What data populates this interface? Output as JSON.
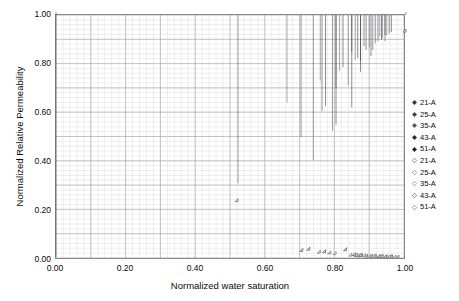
{
  "chart_data": {
    "type": "scatter",
    "title": "",
    "xlabel": "Normalized water saturation",
    "ylabel": "Normalized Relative Permeability",
    "xlim": [
      0.0,
      1.0
    ],
    "ylim": [
      0.0,
      1.0
    ],
    "xticks": [
      "0.00",
      "0.20",
      "0.40",
      "0.60",
      "0.80",
      "1.00"
    ],
    "xtick_values": [
      0.0,
      0.2,
      0.4,
      0.6,
      0.8,
      1.0
    ],
    "yticks": [
      "0.00",
      "0.20",
      "0.40",
      "0.60",
      "0.80",
      "1.00"
    ],
    "ytick_values": [
      0.0,
      0.2,
      0.4,
      0.6,
      0.8,
      1.0
    ],
    "grid": true,
    "grid_minor_step": 0.02,
    "grid_major_step_x": 0.1,
    "grid_major_step_y": 0.1,
    "legend_position": "right",
    "marker": "diamond",
    "series": [
      {
        "name": "21-A",
        "marker": "filled-diamond",
        "color": "#2f2f36",
        "points": [
          [
            0.0,
            1.0
          ],
          [
            0.7,
            0.49
          ],
          [
            0.76,
            0.595
          ],
          [
            0.8,
            0.69
          ],
          [
            0.845,
            0.835
          ],
          [
            0.88,
            0.86
          ],
          [
            0.93,
            0.885
          ],
          [
            1.0,
            1.0
          ]
        ]
      },
      {
        "name": "25-A",
        "marker": "filled-diamond",
        "color": "#3a3a42",
        "points": [
          [
            0.0,
            0.0
          ],
          [
            0.52,
            0.3
          ],
          [
            0.735,
            0.395
          ],
          [
            0.79,
            0.515
          ],
          [
            0.835,
            0.7
          ],
          [
            0.87,
            0.8
          ],
          [
            0.905,
            0.845
          ],
          [
            0.94,
            0.88
          ]
        ]
      },
      {
        "name": "35-A",
        "marker": "filled-diamond",
        "color": "#55555e",
        "points": [
          [
            0.66,
            0.63
          ],
          [
            0.755,
            0.72
          ],
          [
            0.81,
            0.76
          ],
          [
            0.855,
            0.805
          ],
          [
            0.895,
            0.855
          ],
          [
            0.925,
            0.9
          ],
          [
            0.945,
            0.905
          ]
        ]
      },
      {
        "name": "43-A",
        "marker": "filled-diamond",
        "color": "#23232a",
        "points": [
          [
            0.77,
            0.615
          ],
          [
            0.82,
            0.775
          ],
          [
            0.862,
            0.812
          ],
          [
            0.886,
            0.845
          ],
          [
            0.912,
            0.872
          ],
          [
            0.932,
            0.893
          ],
          [
            0.952,
            0.912
          ]
        ]
      },
      {
        "name": "51-A",
        "marker": "filled-diamond",
        "color": "#1c1c22",
        "points": [
          [
            0.8,
            0.54
          ],
          [
            0.845,
            0.61
          ],
          [
            0.87,
            0.755
          ],
          [
            0.9,
            0.82
          ],
          [
            0.92,
            0.88
          ],
          [
            0.94,
            0.905
          ],
          [
            0.958,
            0.918
          ]
        ]
      },
      {
        "name": "21-A",
        "marker": "open-diamond",
        "color": "#6e6e78",
        "points": [
          [
            0.705,
            0.035
          ],
          [
            0.725,
            0.04
          ],
          [
            0.77,
            0.03
          ],
          [
            0.83,
            0.038
          ],
          [
            0.875,
            0.015
          ],
          [
            0.915,
            0.012
          ],
          [
            0.96,
            0.01
          ],
          [
            1.0,
            0.93
          ]
        ]
      },
      {
        "name": "25-A",
        "marker": "open-diamond",
        "color": "#7a7a84",
        "points": [
          [
            0.52,
            0.238
          ],
          [
            0.755,
            0.028
          ],
          [
            0.785,
            0.025
          ],
          [
            0.86,
            0.014
          ],
          [
            0.89,
            0.012
          ],
          [
            0.925,
            0.01
          ],
          [
            0.98,
            0.008
          ]
        ]
      },
      {
        "name": "35-A",
        "marker": "open-diamond",
        "color": "#8b8b95",
        "points": [
          [
            0.8,
            0.022
          ],
          [
            0.845,
            0.016
          ],
          [
            0.868,
            0.013
          ],
          [
            0.898,
            0.011
          ],
          [
            0.932,
            0.01
          ],
          [
            0.948,
            0.009
          ]
        ]
      },
      {
        "name": "43-A",
        "marker": "open-diamond",
        "color": "#70707a",
        "points": [
          [
            0.855,
            0.018
          ],
          [
            0.872,
            0.014
          ],
          [
            0.905,
            0.012
          ],
          [
            0.928,
            0.01
          ],
          [
            0.944,
            0.009
          ],
          [
            0.962,
            0.008
          ]
        ]
      },
      {
        "name": "51-A",
        "marker": "open-diamond",
        "color": "#82828c",
        "points": [
          [
            0.862,
            0.016
          ],
          [
            0.884,
            0.013
          ],
          [
            0.912,
            0.011
          ],
          [
            0.936,
            0.01
          ],
          [
            0.955,
            0.009
          ],
          [
            0.972,
            0.008
          ]
        ]
      }
    ]
  },
  "colors": {
    "grid_minor": "#e2e2e6",
    "grid_major": "#9a9aa2",
    "frame": "#8a8a8a",
    "text": "#0a0a0a",
    "background": "#ffffff"
  }
}
